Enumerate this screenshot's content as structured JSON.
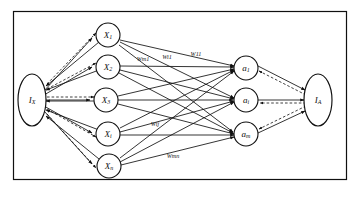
{
  "diagram": {
    "background_color": "#ffffff",
    "stroke_color": "#101010",
    "frame": {
      "name": "outer-border"
    },
    "left_field": {
      "label": "I",
      "subscript": "X",
      "full": "Ix"
    },
    "right_field": {
      "label": "I",
      "subscript": "A",
      "full": "IA"
    },
    "input_nodes": [
      {
        "label": "X",
        "subscript": "1",
        "full": "X1"
      },
      {
        "label": "X",
        "subscript": "2",
        "full": "X2"
      },
      {
        "label": "X",
        "subscript": "3",
        "full": "X3"
      },
      {
        "label": "X",
        "subscript": "i",
        "full": "Xi"
      },
      {
        "label": "X",
        "subscript": "n",
        "full": "Xn"
      }
    ],
    "output_nodes": [
      {
        "label": "a",
        "subscript": "1",
        "full": "a1"
      },
      {
        "label": "a",
        "subscript": "i",
        "full": "ai"
      },
      {
        "label": "a",
        "subscript": "m",
        "full": "am"
      }
    ],
    "weight_labels": [
      {
        "id": "w-m1",
        "text": "Wm1"
      },
      {
        "id": "w-i1",
        "text": "Wi1"
      },
      {
        "id": "w-11",
        "text": "W11"
      },
      {
        "id": "w-ij",
        "text": "Wij"
      },
      {
        "id": "w-mn",
        "text": "Wmn"
      }
    ],
    "edge_styles": {
      "solid": "solid",
      "dashed": "dashed"
    }
  }
}
